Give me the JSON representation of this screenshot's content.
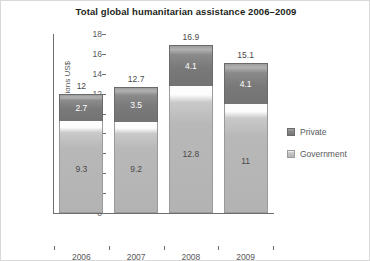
{
  "chart_data": {
    "type": "bar",
    "subtype": "stacked-column",
    "title": "Total global humanitarian assistance 2006–2009",
    "xlabel": "",
    "ylabel": "Billions US$",
    "ylim": [
      0,
      18
    ],
    "yticks": [
      0,
      2,
      4,
      6,
      8,
      10,
      12,
      14,
      16,
      18
    ],
    "ytick_labels": [
      "0",
      "2",
      "4",
      "6",
      "8",
      "10",
      "12",
      "14",
      "16",
      "18"
    ],
    "grid": false,
    "legend_position": "right",
    "categories": [
      "2006",
      "2007",
      "2008",
      "2009"
    ],
    "category_sublabels": [
      "",
      "",
      "",
      "(est)"
    ],
    "series": [
      {
        "name": "Government",
        "color": "#b3b3b3",
        "values": [
          9.3,
          9.2,
          12.8,
          11
        ],
        "value_labels": [
          "9.3",
          "9.2",
          "12.8",
          "11"
        ]
      },
      {
        "name": "Private",
        "color": "#767676",
        "values": [
          2.7,
          3.5,
          4.1,
          4.1
        ],
        "value_labels": [
          "2.7",
          "3.5",
          "4.1",
          "4.1"
        ]
      }
    ],
    "totals": [
      12,
      12.7,
      16.9,
      15.1
    ],
    "total_labels": [
      "12",
      "12.7",
      "16.9",
      "15.1"
    ]
  },
  "legend": {
    "items": [
      {
        "label": "Private",
        "swatch": "priv"
      },
      {
        "label": "Government",
        "swatch": "gov"
      }
    ]
  }
}
